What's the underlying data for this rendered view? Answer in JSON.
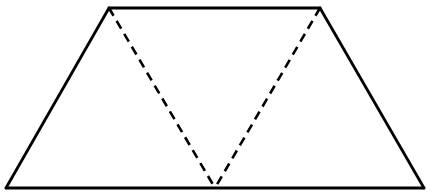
{
  "diagram": {
    "type": "geometric-figure",
    "shape": "trapezoid",
    "stroke_color": "#000000",
    "background": "#ffffff",
    "vertices": {
      "top_left": [
        109,
        8
      ],
      "top_right": [
        320,
        8
      ],
      "bottom_right": [
        424,
        188
      ],
      "bottom_left": [
        6,
        188
      ],
      "bottom_mid": [
        215,
        188
      ]
    },
    "solid_edges": [
      [
        "top_left",
        "top_right"
      ],
      [
        "top_right",
        "bottom_right"
      ],
      [
        "bottom_right",
        "bottom_left"
      ],
      [
        "bottom_left",
        "top_left"
      ]
    ],
    "dashed_edges": [
      [
        "top_left",
        "bottom_mid"
      ],
      [
        "top_right",
        "bottom_mid"
      ]
    ],
    "labels": []
  }
}
